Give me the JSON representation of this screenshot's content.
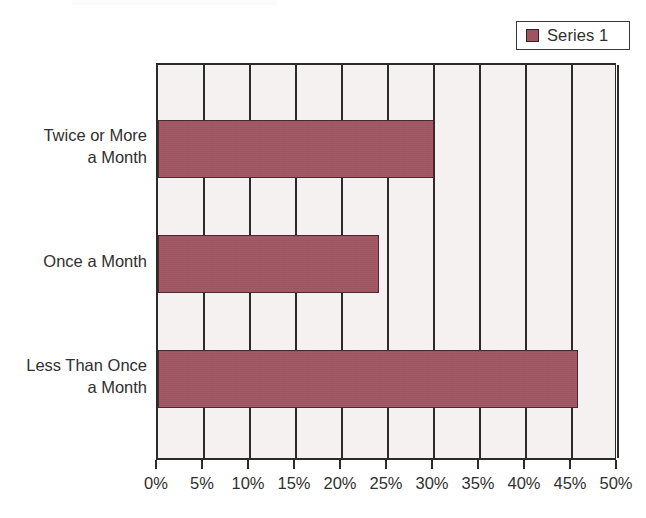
{
  "chart_data": {
    "type": "bar",
    "orientation": "horizontal",
    "title": "",
    "subtitle": "",
    "xlabel": "",
    "ylabel": "",
    "categories": [
      "Twice or More\na Month",
      "Once a Month",
      "Less Than Once\na Month"
    ],
    "series": [
      {
        "name": "Series 1",
        "values": [
          30,
          24,
          45.7
        ],
        "color": "#9E5560"
      }
    ],
    "xlim": [
      0,
      50
    ],
    "x_tick_step": 5,
    "x_tick_labels": [
      "0%",
      "5%",
      "10%",
      "15%",
      "20%",
      "25%",
      "30%",
      "35%",
      "40%",
      "45%",
      "50%"
    ],
    "x_tick_values": [
      0,
      5,
      10,
      15,
      20,
      25,
      30,
      35,
      40,
      45,
      50
    ],
    "value_format": "percent",
    "grid": "vertical",
    "legend_position": "top-right",
    "plot_background": "#F5F1F1",
    "axis_color": "#2b2b2b"
  },
  "legend": {
    "entries": [
      {
        "label": "Series 1",
        "swatch_color": "#9E5560"
      }
    ]
  }
}
